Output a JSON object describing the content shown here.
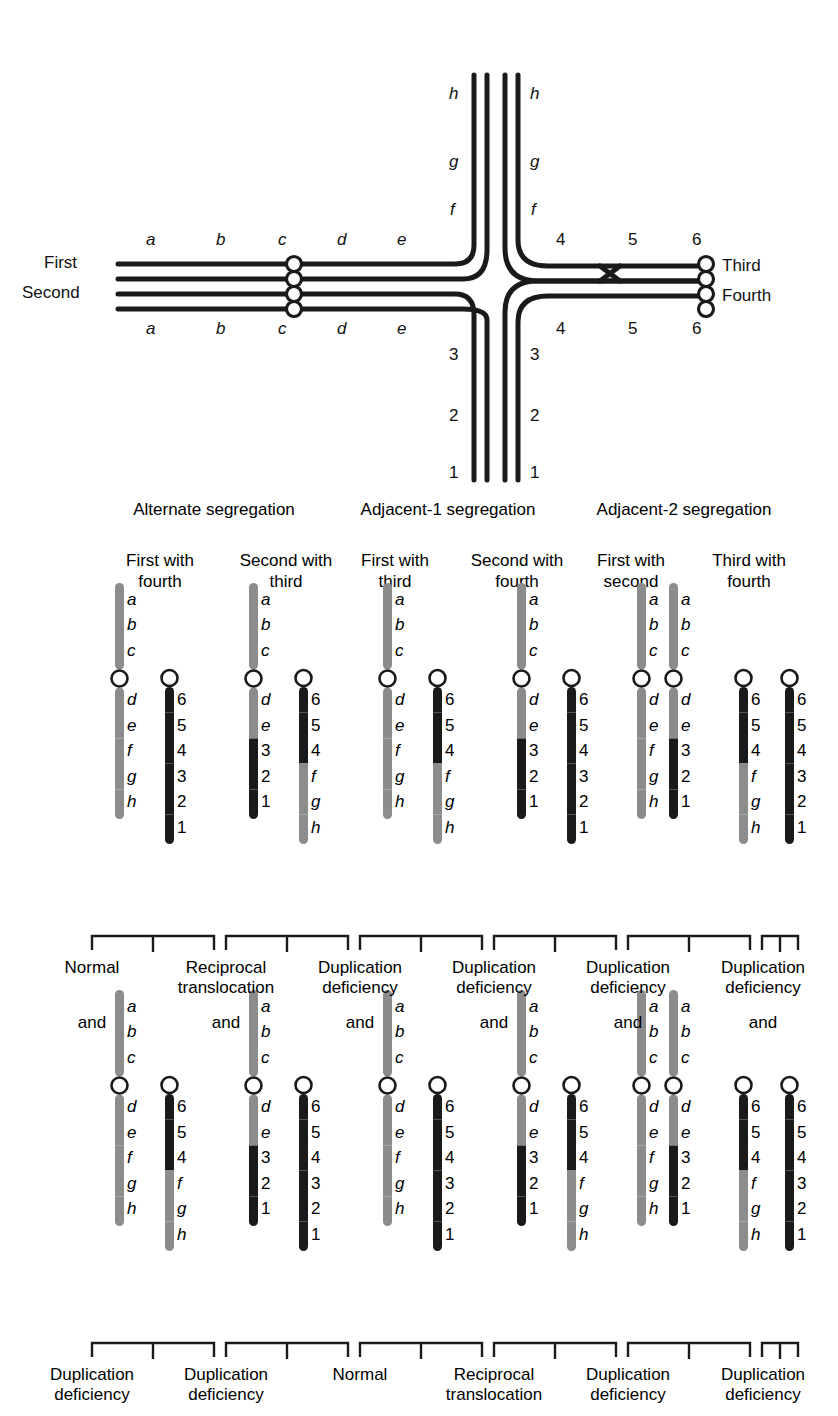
{
  "figure": {
    "type": "genetics-diagram"
  },
  "cross": {
    "left_labels": [
      "First",
      "Second"
    ],
    "right_labels": [
      "Third",
      "Fourth"
    ],
    "left_arm_top_letters": [
      "a",
      "b",
      "c",
      "d",
      "e"
    ],
    "left_arm_bottom_letters": [
      "a",
      "b",
      "c",
      "d",
      "e"
    ],
    "right_arm_top_numbers": [
      "4",
      "5",
      "6"
    ],
    "right_arm_bottom_numbers": [
      "4",
      "5",
      "6"
    ],
    "up_arm_left_letters": [
      "f",
      "g",
      "h"
    ],
    "up_arm_right_letters": [
      "f",
      "g",
      "h"
    ],
    "down_arm_left_numbers": [
      "3",
      "2",
      "1"
    ],
    "down_arm_right_numbers": [
      "3",
      "2",
      "1"
    ]
  },
  "sections": [
    {
      "title": "Alternate segregation"
    },
    {
      "title": "Adjacent-1 segregation"
    },
    {
      "title": "Adjacent-2 segregation"
    }
  ],
  "columns": [
    {
      "head_line1": "First with",
      "head_line2": "fourth"
    },
    {
      "head_line1": "Second with",
      "head_line2": "third"
    },
    {
      "head_line1": "First with",
      "head_line2": "third"
    },
    {
      "head_line1": "Second with",
      "head_line2": "fourth"
    },
    {
      "head_line1": "First with",
      "head_line2": "second"
    },
    {
      "head_line1": "Third with",
      "head_line2": "fourth"
    }
  ],
  "connector": {
    "and_label": "and"
  },
  "outcomes": {
    "row1": [
      {
        "line1": "Normal",
        "line2": ""
      },
      {
        "line1": "Reciprocal",
        "line2": "translocation"
      },
      {
        "line1": "Duplication",
        "line2": "deficiency"
      },
      {
        "line1": "Duplication",
        "line2": "deficiency"
      },
      {
        "line1": "Duplication",
        "line2": "deficiency"
      },
      {
        "line1": "Duplication",
        "line2": "deficiency"
      }
    ],
    "row2": [
      {
        "line1": "Duplication",
        "line2": "deficiency"
      },
      {
        "line1": "Duplication",
        "line2": "deficiency"
      },
      {
        "line1": "Normal",
        "line2": ""
      },
      {
        "line1": "Reciprocal",
        "line2": "translocation"
      },
      {
        "line1": "Duplication",
        "line2": "deficiency"
      },
      {
        "line1": "Duplication",
        "line2": "deficiency"
      }
    ]
  },
  "colors": {
    "gray_chromosome": "#8c8c8c",
    "black_chromosome": "#1a1a1a",
    "centromere_fill": "#ffffff",
    "outline": "#1a1a1a",
    "text": "#111111",
    "background": "#ffffff"
  },
  "chart_data": {
    "type": "diagram",
    "chromosome_products": {
      "row1": [
        {
          "column": "First with fourth",
          "chromosomes": [
            {
              "short_arm": [
                "a",
                "b",
                "c"
              ],
              "short_arm_color": "gray",
              "long_arm_labels": [
                "d",
                "e",
                "f",
                "g",
                "h"
              ],
              "long_arm_colors": [
                "gray",
                "gray",
                "gray",
                "gray",
                "gray"
              ]
            },
            {
              "short_arm": [],
              "short_arm_color": "black",
              "long_arm_labels": [
                "6",
                "5",
                "4",
                "3",
                "2",
                "1"
              ],
              "long_arm_colors": [
                "black",
                "black",
                "black",
                "black",
                "black",
                "black"
              ]
            }
          ]
        },
        {
          "column": "Second with third",
          "chromosomes": [
            {
              "short_arm": [
                "a",
                "b",
                "c"
              ],
              "short_arm_color": "gray",
              "long_arm_labels": [
                "d",
                "e",
                "3",
                "2",
                "1"
              ],
              "long_arm_colors": [
                "gray",
                "gray",
                "black",
                "black",
                "black"
              ]
            },
            {
              "short_arm": [],
              "short_arm_color": "black",
              "long_arm_labels": [
                "6",
                "5",
                "4",
                "f",
                "g",
                "h"
              ],
              "long_arm_colors": [
                "black",
                "black",
                "black",
                "gray",
                "gray",
                "gray"
              ]
            }
          ]
        },
        {
          "column": "First with third",
          "chromosomes": [
            {
              "short_arm": [
                "a",
                "b",
                "c"
              ],
              "short_arm_color": "gray",
              "long_arm_labels": [
                "d",
                "e",
                "f",
                "g",
                "h"
              ],
              "long_arm_colors": [
                "gray",
                "gray",
                "gray",
                "gray",
                "gray"
              ]
            },
            {
              "short_arm": [],
              "short_arm_color": "black",
              "long_arm_labels": [
                "6",
                "5",
                "4",
                "f",
                "g",
                "h"
              ],
              "long_arm_colors": [
                "black",
                "black",
                "black",
                "gray",
                "gray",
                "gray"
              ]
            }
          ]
        },
        {
          "column": "Second with fourth",
          "chromosomes": [
            {
              "short_arm": [
                "a",
                "b",
                "c"
              ],
              "short_arm_color": "gray",
              "long_arm_labels": [
                "d",
                "e",
                "3",
                "2",
                "1"
              ],
              "long_arm_colors": [
                "gray",
                "gray",
                "black",
                "black",
                "black"
              ]
            },
            {
              "short_arm": [],
              "short_arm_color": "black",
              "long_arm_labels": [
                "6",
                "5",
                "4",
                "3",
                "2",
                "1"
              ],
              "long_arm_colors": [
                "black",
                "black",
                "black",
                "black",
                "black",
                "black"
              ]
            }
          ]
        },
        {
          "column": "First with second",
          "chromosomes": [
            {
              "short_arm": [
                "a",
                "b",
                "c"
              ],
              "short_arm_color": "gray",
              "long_arm_labels": [
                "d",
                "e",
                "f",
                "g",
                "h"
              ],
              "long_arm_colors": [
                "gray",
                "gray",
                "gray",
                "gray",
                "gray"
              ]
            },
            {
              "short_arm": [
                "a",
                "b",
                "c"
              ],
              "short_arm_color": "gray",
              "long_arm_labels": [
                "d",
                "e",
                "3",
                "2",
                "1"
              ],
              "long_arm_colors": [
                "gray",
                "gray",
                "black",
                "black",
                "black"
              ]
            }
          ]
        },
        {
          "column": "Third with fourth",
          "chromosomes": [
            {
              "short_arm": [],
              "short_arm_color": "black",
              "long_arm_labels": [
                "6",
                "5",
                "4",
                "f",
                "g",
                "h"
              ],
              "long_arm_colors": [
                "black",
                "black",
                "black",
                "gray",
                "gray",
                "gray"
              ]
            },
            {
              "short_arm": [],
              "short_arm_color": "black",
              "long_arm_labels": [
                "6",
                "5",
                "4",
                "3",
                "2",
                "1"
              ],
              "long_arm_colors": [
                "black",
                "black",
                "black",
                "black",
                "black",
                "black"
              ]
            }
          ]
        }
      ],
      "row2": [
        {
          "column": "First with fourth",
          "chromosomes": [
            {
              "short_arm": [
                "a",
                "b",
                "c"
              ],
              "short_arm_color": "gray",
              "long_arm_labels": [
                "d",
                "e",
                "f",
                "g",
                "h"
              ],
              "long_arm_colors": [
                "gray",
                "gray",
                "gray",
                "gray",
                "gray"
              ]
            },
            {
              "short_arm": [],
              "short_arm_color": "black",
              "long_arm_labels": [
                "6",
                "5",
                "4",
                "f",
                "g",
                "h"
              ],
              "long_arm_colors": [
                "black",
                "black",
                "black",
                "gray",
                "gray",
                "gray"
              ]
            }
          ]
        },
        {
          "column": "Second with third",
          "chromosomes": [
            {
              "short_arm": [
                "a",
                "b",
                "c"
              ],
              "short_arm_color": "gray",
              "long_arm_labels": [
                "d",
                "e",
                "3",
                "2",
                "1"
              ],
              "long_arm_colors": [
                "gray",
                "gray",
                "black",
                "black",
                "black"
              ]
            },
            {
              "short_arm": [],
              "short_arm_color": "black",
              "long_arm_labels": [
                "6",
                "5",
                "4",
                "3",
                "2",
                "1"
              ],
              "long_arm_colors": [
                "black",
                "black",
                "black",
                "black",
                "black",
                "black"
              ]
            }
          ]
        },
        {
          "column": "First with third",
          "chromosomes": [
            {
              "short_arm": [
                "a",
                "b",
                "c"
              ],
              "short_arm_color": "gray",
              "long_arm_labels": [
                "d",
                "e",
                "f",
                "g",
                "h"
              ],
              "long_arm_colors": [
                "gray",
                "gray",
                "gray",
                "gray",
                "gray"
              ]
            },
            {
              "short_arm": [],
              "short_arm_color": "black",
              "long_arm_labels": [
                "6",
                "5",
                "4",
                "3",
                "2",
                "1"
              ],
              "long_arm_colors": [
                "black",
                "black",
                "black",
                "black",
                "black",
                "black"
              ]
            }
          ]
        },
        {
          "column": "Second with fourth",
          "chromosomes": [
            {
              "short_arm": [
                "a",
                "b",
                "c"
              ],
              "short_arm_color": "gray",
              "long_arm_labels": [
                "d",
                "e",
                "3",
                "2",
                "1"
              ],
              "long_arm_colors": [
                "gray",
                "gray",
                "black",
                "black",
                "black"
              ]
            },
            {
              "short_arm": [],
              "short_arm_color": "black",
              "long_arm_labels": [
                "6",
                "5",
                "4",
                "f",
                "g",
                "h"
              ],
              "long_arm_colors": [
                "black",
                "black",
                "black",
                "gray",
                "gray",
                "gray"
              ]
            }
          ]
        },
        {
          "column": "First with second",
          "chromosomes": [
            {
              "short_arm": [
                "a",
                "b",
                "c"
              ],
              "short_arm_color": "gray",
              "long_arm_labels": [
                "d",
                "e",
                "f",
                "g",
                "h"
              ],
              "long_arm_colors": [
                "gray",
                "gray",
                "gray",
                "gray",
                "gray"
              ]
            },
            {
              "short_arm": [
                "a",
                "b",
                "c"
              ],
              "short_arm_color": "gray",
              "long_arm_labels": [
                "d",
                "e",
                "3",
                "2",
                "1"
              ],
              "long_arm_colors": [
                "gray",
                "gray",
                "black",
                "black",
                "black"
              ]
            }
          ]
        },
        {
          "column": "Third with fourth",
          "chromosomes": [
            {
              "short_arm": [],
              "short_arm_color": "black",
              "long_arm_labels": [
                "6",
                "5",
                "4",
                "f",
                "g",
                "h"
              ],
              "long_arm_colors": [
                "black",
                "black",
                "black",
                "gray",
                "gray",
                "gray"
              ]
            },
            {
              "short_arm": [],
              "short_arm_color": "black",
              "long_arm_labels": [
                "6",
                "5",
                "4",
                "3",
                "2",
                "1"
              ],
              "long_arm_colors": [
                "black",
                "black",
                "black",
                "black",
                "black",
                "black"
              ]
            }
          ]
        }
      ]
    }
  }
}
